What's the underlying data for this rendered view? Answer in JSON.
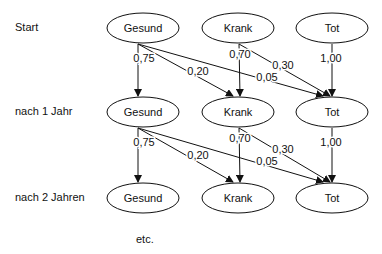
{
  "rows": [
    {
      "label": "Start",
      "y": 28
    },
    {
      "label": "nach 1 Jahr",
      "y": 112
    },
    {
      "label": "nach 2 Jahren",
      "y": 198
    }
  ],
  "states": [
    {
      "name": "Gesund",
      "x": 143
    },
    {
      "name": "Krank",
      "x": 238
    },
    {
      "name": "Tot",
      "x": 332
    }
  ],
  "transitions": [
    {
      "from": "Gesund",
      "to": "Gesund",
      "p": "0,75"
    },
    {
      "from": "Gesund",
      "to": "Krank",
      "p": "0,20"
    },
    {
      "from": "Gesund",
      "to": "Tot",
      "p": "0,05"
    },
    {
      "from": "Krank",
      "to": "Krank",
      "p": "0,70"
    },
    {
      "from": "Krank",
      "to": "Tot",
      "p": "0,30"
    },
    {
      "from": "Tot",
      "to": "Tot",
      "p": "1,00"
    }
  ],
  "footer": {
    "etc": "etc."
  },
  "colors": {
    "stroke": "#111111",
    "text": "#111111",
    "background": "#ffffff"
  }
}
